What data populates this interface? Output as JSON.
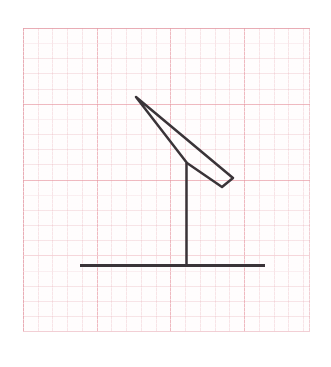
{
  "scene": {
    "title": "Lever arm on vertical post",
    "canvas": {
      "width": 331,
      "height": 367
    },
    "background_color": "#ffffff"
  },
  "grid": {
    "name": "graph-paper",
    "x": 23,
    "y": 28,
    "width": 287,
    "height": 304,
    "paper_color": "#fffdfd",
    "major_line_color": "#e896a0",
    "minor_line_color": "#e9b4bc",
    "major_spacing_x": 73.7,
    "major_spacing_y": 75.8,
    "minor_spacing_x": 14.74,
    "minor_spacing_y": 15.16,
    "border_color": "#e2a0aa"
  },
  "drawing": {
    "ink_color": "#3a3438",
    "stroke_width": 2.6,
    "ground_line": {
      "label": "ground-line",
      "x1": 80,
      "y1": 265.5,
      "x2": 265,
      "y2": 265.5
    },
    "post": {
      "label": "vertical-post",
      "x1": 186.5,
      "y1": 163,
      "x2": 186.5,
      "y2": 265
    },
    "arm": {
      "label": "slanted-arm-bar",
      "points": [
        [
          136,
          97
        ],
        [
          233,
          178
        ],
        [
          222,
          187
        ],
        [
          187,
          163
        ]
      ],
      "top_edge": {
        "x1": 136,
        "y1": 97,
        "x2": 233,
        "y2": 178
      },
      "bottom_edge": {
        "x1": 187,
        "y1": 163,
        "x2": 222,
        "y2": 187
      },
      "tip_edge": {
        "x1": 233,
        "y1": 178,
        "x2": 222,
        "y2": 187
      },
      "pivot": [
        186.5,
        163
      ]
    }
  }
}
